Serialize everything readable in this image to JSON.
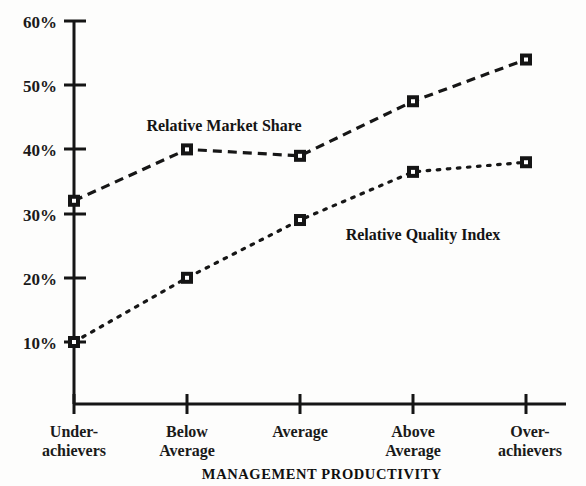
{
  "chart_data": {
    "type": "line",
    "title": "",
    "xlabel": "MANAGEMENT PRODUCTIVITY",
    "ylabel": "",
    "categories": [
      "Under-achievers",
      "Below Average",
      "Average",
      "Above Average",
      "Over-achievers"
    ],
    "category_lines": [
      [
        "Under-",
        "achievers"
      ],
      [
        "Below",
        "Average"
      ],
      [
        "Average",
        ""
      ],
      [
        "Above",
        "Average"
      ],
      [
        "Over-",
        "achievers"
      ]
    ],
    "series": [
      {
        "name": "Relative Market Share",
        "values": [
          32,
          40,
          39,
          47.5,
          54
        ],
        "line_style": "dashed",
        "marker": "square",
        "label_text": "Relative Market Share"
      },
      {
        "name": "Relative Quality Index",
        "values": [
          10,
          20,
          29,
          36.5,
          38
        ],
        "line_style": "dotted",
        "marker": "square",
        "label_text": "Relative Quality Index"
      }
    ],
    "ylim": [
      0,
      60
    ],
    "ytick_values": [
      10,
      20,
      30,
      40,
      50,
      60
    ],
    "ytick_labels": [
      "10%",
      "20%",
      "30%",
      "40%",
      "50%",
      "60%"
    ],
    "grid": false,
    "legend": "inline-annotations",
    "colors": {
      "axis": "#151515",
      "series_1": "#161616",
      "series_2": "#161616",
      "background": "#fdfdfc",
      "text": "#1a1a1a"
    }
  },
  "annotations": {
    "market_share_label": "Relative Market Share",
    "quality_index_label": "Relative Quality Index"
  },
  "axis": {
    "x_title": "MANAGEMENT PRODUCTIVITY"
  }
}
